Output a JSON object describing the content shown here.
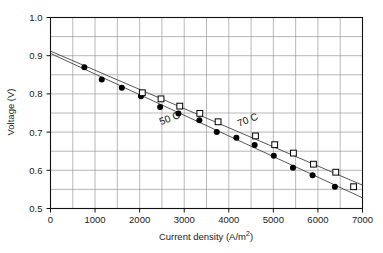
{
  "chart_data": {
    "type": "scatter",
    "title": "",
    "xlabel": "Current density  (A/m2)",
    "xlabel_base": "Current density  (A/m",
    "xlabel_sup": "2",
    "xlabel_tail": ")",
    "ylabel": "Voltage  (V)",
    "xlim": [
      0,
      7000
    ],
    "ylim": [
      0.5,
      1.0
    ],
    "xticks": [
      0,
      1000,
      2000,
      3000,
      4000,
      5000,
      6000,
      7000
    ],
    "xtick_labels": [
      "0",
      "1000",
      "2000",
      "3000",
      "4000",
      "5000",
      "6000",
      "7000"
    ],
    "yticks": [
      0.5,
      0.6,
      0.7,
      0.8,
      0.9,
      1.0
    ],
    "ytick_labels": [
      "0.5",
      "0.6",
      "0.7",
      "0.8",
      "0.9",
      "1.0"
    ],
    "grid": true,
    "grid_x_step": 500,
    "grid_y_step": 0.05,
    "grid_color": "#9a9a9a",
    "axis_color": "#111111",
    "legend": "none",
    "annotations": [
      {
        "text": "50 C",
        "x": 2700,
        "y": 0.728,
        "rotation": -22
      },
      {
        "text": "70 C",
        "x": 4450,
        "y": 0.724,
        "rotation": -22
      }
    ],
    "series": [
      {
        "name": "50 C",
        "marker": "filled-circle",
        "color": "#000000",
        "points": [
          {
            "x": 760,
            "y": 0.87
          },
          {
            "x": 1150,
            "y": 0.838
          },
          {
            "x": 1600,
            "y": 0.816
          },
          {
            "x": 2030,
            "y": 0.794
          },
          {
            "x": 2460,
            "y": 0.766
          },
          {
            "x": 2870,
            "y": 0.749
          },
          {
            "x": 3340,
            "y": 0.731
          },
          {
            "x": 3730,
            "y": 0.7
          },
          {
            "x": 4170,
            "y": 0.685
          },
          {
            "x": 4580,
            "y": 0.666
          },
          {
            "x": 5010,
            "y": 0.638
          },
          {
            "x": 5440,
            "y": 0.607
          },
          {
            "x": 5880,
            "y": 0.587
          },
          {
            "x": 6380,
            "y": 0.557
          }
        ],
        "fit_line": {
          "x0": 0,
          "y0": 0.906,
          "x1": 7000,
          "y1": 0.528
        }
      },
      {
        "name": "70 C",
        "marker": "open-square",
        "color": "#000000",
        "points": [
          {
            "x": 2060,
            "y": 0.803
          },
          {
            "x": 2480,
            "y": 0.787
          },
          {
            "x": 2900,
            "y": 0.768
          },
          {
            "x": 3350,
            "y": 0.749
          },
          {
            "x": 3760,
            "y": 0.727
          },
          {
            "x": 4600,
            "y": 0.69
          },
          {
            "x": 5030,
            "y": 0.667
          },
          {
            "x": 5450,
            "y": 0.645
          },
          {
            "x": 5900,
            "y": 0.616
          },
          {
            "x": 6400,
            "y": 0.595
          },
          {
            "x": 6800,
            "y": 0.557
          }
        ],
        "fit_line": {
          "x0": 0,
          "y0": 0.912,
          "x1": 7000,
          "y1": 0.561
        }
      }
    ]
  }
}
